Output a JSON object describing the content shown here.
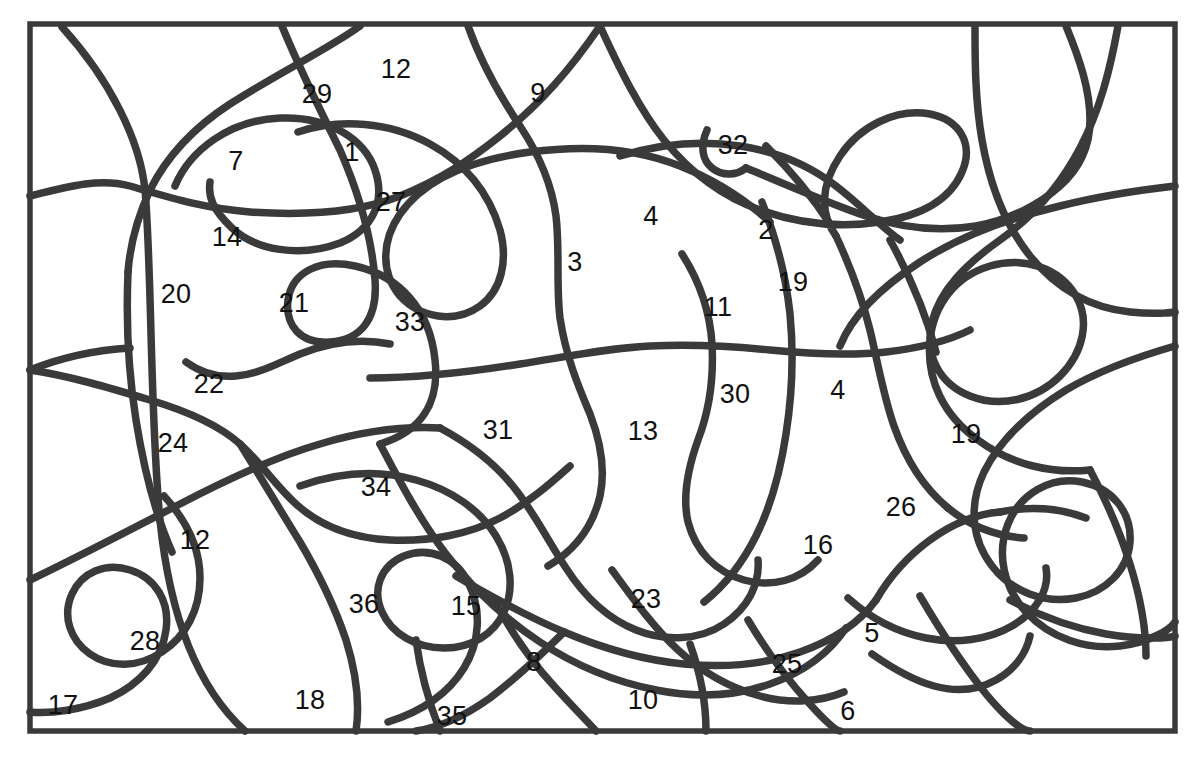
{
  "figure": {
    "kind": "hand-drawn-region-map",
    "width": 1200,
    "height": 759,
    "background_color": "#ffffff",
    "stroke_color": "#3a3a3a",
    "label_color": "#111111",
    "frame": {
      "x": 30,
      "y": 24,
      "width": 1145,
      "height": 707
    }
  },
  "labels": [
    {
      "text": "12",
      "x": 396,
      "y": 69
    },
    {
      "text": "29",
      "x": 317,
      "y": 94
    },
    {
      "text": "9",
      "x": 538,
      "y": 93
    },
    {
      "text": "32",
      "x": 733,
      "y": 145
    },
    {
      "text": "7",
      "x": 236,
      "y": 161
    },
    {
      "text": "1",
      "x": 352,
      "y": 152
    },
    {
      "text": "27",
      "x": 391,
      "y": 202
    },
    {
      "text": "4",
      "x": 651,
      "y": 216
    },
    {
      "text": "2",
      "x": 766,
      "y": 230
    },
    {
      "text": "14",
      "x": 227,
      "y": 237
    },
    {
      "text": "3",
      "x": 575,
      "y": 262
    },
    {
      "text": "19",
      "x": 793,
      "y": 282
    },
    {
      "text": "20",
      "x": 176,
      "y": 294
    },
    {
      "text": "21",
      "x": 294,
      "y": 303
    },
    {
      "text": "11",
      "x": 718,
      "y": 307
    },
    {
      "text": "33",
      "x": 410,
      "y": 322
    },
    {
      "text": "22",
      "x": 209,
      "y": 384
    },
    {
      "text": "30",
      "x": 735,
      "y": 394
    },
    {
      "text": "4",
      "x": 838,
      "y": 390
    },
    {
      "text": "31",
      "x": 498,
      "y": 430
    },
    {
      "text": "13",
      "x": 643,
      "y": 431
    },
    {
      "text": "19",
      "x": 966,
      "y": 434
    },
    {
      "text": "24",
      "x": 173,
      "y": 443
    },
    {
      "text": "34",
      "x": 376,
      "y": 487
    },
    {
      "text": "26",
      "x": 901,
      "y": 507
    },
    {
      "text": "12",
      "x": 195,
      "y": 540
    },
    {
      "text": "16",
      "x": 818,
      "y": 545
    },
    {
      "text": "36",
      "x": 364,
      "y": 604
    },
    {
      "text": "15",
      "x": 466,
      "y": 606
    },
    {
      "text": "23",
      "x": 646,
      "y": 599
    },
    {
      "text": "5",
      "x": 872,
      "y": 633
    },
    {
      "text": "28",
      "x": 145,
      "y": 641
    },
    {
      "text": "8",
      "x": 534,
      "y": 662
    },
    {
      "text": "25",
      "x": 787,
      "y": 664
    },
    {
      "text": "10",
      "x": 643,
      "y": 700
    },
    {
      "text": "6",
      "x": 848,
      "y": 711
    },
    {
      "text": "17",
      "x": 63,
      "y": 705
    },
    {
      "text": "18",
      "x": 310,
      "y": 700
    },
    {
      "text": "35",
      "x": 452,
      "y": 716
    }
  ],
  "curves": [
    "M 62 27 C 110 80 140 140 145 190 C 152 270 150 420 160 520 C 170 620 200 690 245 731",
    "M 30 196 C 70 186 100 178 130 186 C 165 196 200 208 250 212 C 310 216 360 212 400 196 C 440 180 470 160 500 136 C 540 104 570 70 600 26",
    "M 360 26 C 330 48 280 72 230 104 C 190 130 165 160 150 190 C 138 216 130 245 128 272",
    "M 175 186 C 190 150 230 120 280 118 C 330 116 365 140 375 170 C 386 202 372 230 340 243 C 300 258 255 250 232 228 C 212 209 208 196 210 182",
    "M 282 26 C 300 70 320 110 340 150 C 360 196 372 240 375 280 C 378 320 360 340 330 342 C 300 344 285 325 288 300 C 292 272 320 258 355 266 C 400 276 430 310 435 360 C 440 404 420 432 380 444",
    "M 468 26 C 480 60 500 96 520 126 C 540 156 552 186 556 216 C 560 250 556 286 560 318 C 566 358 580 390 590 414 C 600 440 606 468 600 496 C 592 530 572 552 548 566",
    "M 298 132 C 340 118 390 122 430 144 C 470 166 490 196 500 230 C 508 260 502 290 480 306 C 455 324 420 318 400 296 C 380 272 382 240 400 214 C 424 180 470 160 530 152 C 590 144 640 150 680 166 C 720 182 748 202 770 222",
    "M 600 26 C 620 70 640 110 664 140 C 690 172 720 196 760 210 C 800 224 840 228 880 222 C 920 216 950 200 962 172 C 974 144 960 120 930 114 C 896 108 860 126 840 156 C 820 186 820 214 836 236",
    "M 620 156 C 660 144 700 140 740 146 C 780 152 810 166 836 186 C 862 206 880 226 900 240",
    "M 707 130 C 700 146 702 160 712 168 C 722 176 736 176 746 168",
    "M 746 168 C 790 186 830 204 866 216 C 902 228 940 232 976 226 C 1010 220 1040 204 1060 186 C 1080 168 1090 146 1090 120 C 1090 90 1080 60 1066 26",
    "M 975 26 C 975 60 975 100 982 140 C 990 186 1006 226 1030 256 C 1056 288 1090 308 1130 312 C 1160 315 1175 312 1175 312",
    "M 1175 186 C 1140 190 1100 196 1060 206 C 1010 218 960 236 920 262 C 880 288 852 316 840 346",
    "M 1118 26 C 1110 70 1100 110 1080 148 C 1060 186 1034 216 1000 240 C 966 264 940 290 932 322 C 924 356 940 384 970 396 C 1000 408 1036 400 1060 376 C 1084 352 1090 320 1076 296 C 1060 268 1024 256 990 266 C 956 276 934 304 930 340 C 926 380 944 416 978 440 C 1010 464 1050 474 1090 470",
    "M 1175 346 C 1140 356 1100 370 1066 390 C 1030 412 1000 440 984 472 C 968 506 972 540 992 566 C 1012 592 1044 604 1076 598 C 1106 592 1128 570 1130 542 C 1132 512 1112 488 1082 482 C 1050 476 1020 494 1008 524 C 996 554 1004 588 1026 612 C 1050 638 1086 650 1120 646 C 1150 642 1170 630 1175 622",
    "M 682 254 C 700 282 710 312 712 344 C 714 380 708 414 698 440 C 688 468 682 496 688 522 C 696 552 716 572 744 580 C 772 588 800 580 818 560",
    "M 762 202 C 776 238 786 276 790 314 C 794 356 792 396 786 434 C 780 474 770 508 756 536 C 742 564 724 586 704 602",
    "M 370 378 C 420 378 470 372 520 364 C 570 356 610 348 650 346 C 690 344 730 346 770 350 C 810 354 850 356 886 352 C 920 348 950 340 970 330",
    "M 30 370 C 70 376 110 388 150 400 C 190 412 220 426 240 444 C 262 464 276 486 296 504 C 320 526 350 538 390 540 C 430 542 470 534 500 518 C 530 502 552 482 570 466",
    "M 186 362 C 200 372 216 378 236 376 C 260 374 280 362 300 354 C 330 342 360 338 390 344",
    "M 30 580 C 80 556 130 530 180 504 C 230 478 278 456 320 444 C 360 432 400 426 440 428",
    "M 240 444 C 260 476 280 510 300 542 C 320 576 336 610 346 640 C 356 672 360 704 356 731",
    "M 300 486 C 340 472 380 470 416 480 C 452 490 480 510 496 536 C 512 562 514 590 504 612 C 494 634 472 648 444 648 C 416 648 392 634 382 612 C 372 590 380 566 404 556 C 430 546 456 558 468 582 C 482 610 480 642 464 668 C 448 694 420 712 388 722",
    "M 164 496 C 186 520 200 548 200 578 C 200 610 186 636 162 652 C 138 668 110 668 90 654 C 70 640 62 616 72 594 C 82 572 106 562 130 570 C 156 578 170 602 166 630 C 162 660 140 684 110 698 C 82 710 50 714 30 712",
    "M 440 428 C 470 444 496 464 516 490 C 536 516 550 544 566 568 C 584 596 606 618 636 630 C 666 642 700 640 724 624 C 748 608 760 584 758 560",
    "M 380 444 C 400 482 420 520 446 554 C 472 588 504 618 540 642 C 576 666 616 682 656 690 C 696 698 736 696 770 684 C 804 672 830 652 846 628",
    "M 456 576 C 490 596 526 616 564 632 C 602 648 642 660 684 664 C 726 668 766 664 800 652 C 834 640 860 622 876 600",
    "M 612 570 C 634 600 654 628 678 650 C 702 672 730 688 760 696 C 790 704 820 702 844 692",
    "M 848 598 C 870 618 896 632 926 638 C 956 644 988 640 1012 626 C 1036 612 1050 590 1046 568",
    "M 872 654 C 892 668 912 680 934 686 C 956 692 978 690 996 680 C 1014 670 1026 654 1030 636",
    "M 920 596 C 940 630 962 664 986 694 C 1006 718 1022 731 1030 731",
    "M 1090 470 C 1106 500 1120 532 1130 564 C 1140 596 1146 628 1146 656",
    "M 1010 600 C 1040 616 1072 628 1106 634 C 1140 640 1170 638 1175 636",
    "M 748 620 C 766 650 786 678 808 702 C 824 720 836 731 840 731",
    "M 690 644 C 700 672 706 700 706 731",
    "M 494 600 C 510 630 530 660 554 686 C 572 706 588 722 596 731",
    "M 416 640 C 420 670 428 700 440 731",
    "M 564 632 C 540 656 516 678 490 698 C 462 718 436 728 416 731",
    "M 876 600 C 890 576 908 556 930 540 C 952 524 976 514 1000 512",
    "M 1000 512 C 1030 506 1060 508 1086 518",
    "M 836 236 C 850 266 862 298 870 330 C 878 364 884 398 894 426 C 906 460 924 488 948 508",
    "M 948 508 C 970 526 996 536 1024 538",
    "M 30 370 C 60 358 96 350 130 348",
    "M 128 272 C 126 320 128 370 136 420 C 144 470 156 516 172 552",
    "M 766 146 C 790 170 812 196 830 224",
    "M 890 240 C 910 276 926 314 936 352"
  ]
}
